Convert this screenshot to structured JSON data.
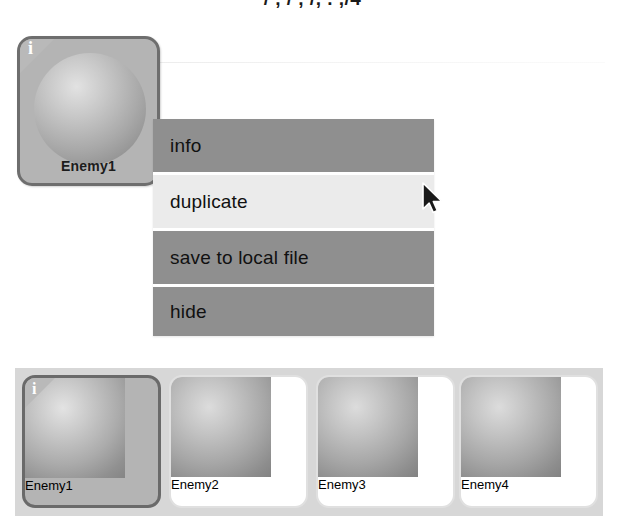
{
  "page": {
    "cropped_top_text": "/   ,   /    ,   /,    .  ,/4"
  },
  "selected_item": {
    "name": "Enemy1",
    "badge": "i",
    "badge_icon": "info-badge-icon"
  },
  "context_menu": {
    "items": [
      {
        "label": "info",
        "highlighted": false
      },
      {
        "label": "duplicate",
        "highlighted": true
      },
      {
        "label": "save to local file",
        "highlighted": false
      },
      {
        "label": "hide",
        "highlighted": false
      }
    ]
  },
  "thumbnail_strip": {
    "cards": [
      {
        "label": "Enemy1",
        "selected": true,
        "badge": "i"
      },
      {
        "label": "Enemy2",
        "selected": false,
        "badge": ""
      },
      {
        "label": "Enemy3",
        "selected": false,
        "badge": ""
      },
      {
        "label": "Enemy4",
        "selected": false,
        "badge": ""
      }
    ]
  },
  "cursor": {
    "icon": "mouse-pointer-icon",
    "x": 421,
    "y": 182
  },
  "colors": {
    "menu_background": "#8f8f8f",
    "menu_highlight": "#ebebeb",
    "panel_background": "#d7d7d7",
    "card_selected_fill": "#b4b4b4",
    "card_selected_border": "#6a6a6a",
    "card_fill": "#ffffff",
    "text": "#111111"
  }
}
